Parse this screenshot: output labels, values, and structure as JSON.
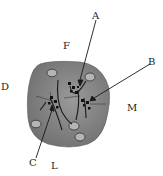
{
  "diagram": {
    "type": "anatomical-section-illustration",
    "labels": {
      "A": "A",
      "B": "B",
      "C": "C",
      "D": "D",
      "F": "F",
      "L": "L",
      "M": "M"
    },
    "colors": {
      "tissue_fill": "#8a8a8a",
      "tissue_edge": "#6a6a6a",
      "lines": "#1a1a1a",
      "vessel_fill": "#b8b8b8"
    }
  }
}
